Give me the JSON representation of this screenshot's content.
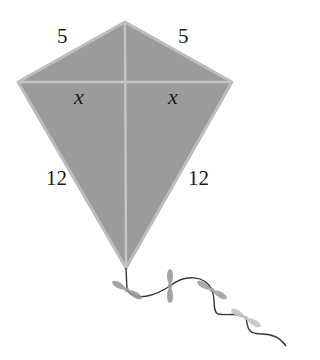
{
  "diagram": {
    "colors": {
      "kite_fill": "#9b9b9b",
      "kite_edge": "#bdbdbd",
      "spar": "#c4c4c4",
      "tail_string": "#3a3a3a",
      "bow": "#a8a8a8",
      "label": "#1a1a1a"
    },
    "vertices": {
      "top": [
        125,
        22
      ],
      "left": [
        18,
        82
      ],
      "right": [
        232,
        82
      ],
      "bottom": [
        126,
        268
      ]
    },
    "labels": {
      "top_left_side": "5",
      "top_right_side": "5",
      "left_cross_segment": "x",
      "right_cross_segment": "x",
      "bottom_left_side": "12",
      "bottom_right_side": "12"
    },
    "tail": {
      "bows": [
        {
          "x": 127,
          "y": 290,
          "rot": -30
        },
        {
          "x": 170,
          "y": 286,
          "rot": 80
        },
        {
          "x": 212,
          "y": 290,
          "rot": -35
        },
        {
          "x": 246,
          "y": 318,
          "rot": -30
        }
      ]
    }
  }
}
